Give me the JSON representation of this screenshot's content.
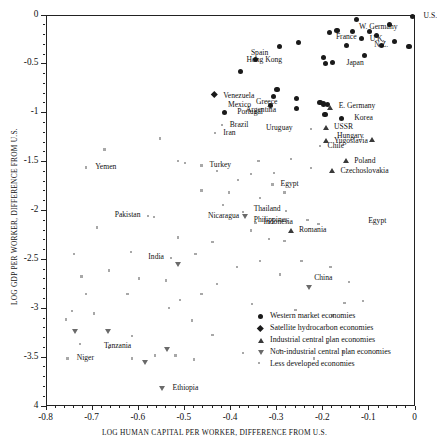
{
  "chart_data": {
    "type": "scatter",
    "title": "",
    "xlabel": "LOG HUMAN CAPITAL PER WORKER, DIFFERENCE FROM U.S.",
    "ylabel": "LOG GDP PER WORKER, DIFFERENCE FROM U.S.",
    "xlim": [
      -0.8,
      0
    ],
    "ylim": [
      -4,
      0
    ],
    "xticks": [
      "-0.8",
      "-0.7",
      "-0.6",
      "-0.5",
      "-0.4",
      "-0.3",
      "-0.2",
      "-0.1",
      "0"
    ],
    "xtick_values": [
      -0.8,
      -0.7,
      -0.6,
      -0.5,
      -0.4,
      -0.3,
      -0.2,
      -0.1,
      0
    ],
    "yticks": [
      "0",
      "-0.5",
      "-1",
      "-1.5",
      "-2",
      "-2.5",
      "-3",
      "-3.5",
      "4"
    ],
    "ytick_values": [
      0,
      -0.5,
      -1,
      -1.5,
      -2,
      -2.5,
      -3,
      -3.5,
      -4
    ],
    "grid": false,
    "legend_position": "inside-lower-right",
    "series": [
      {
        "name": "Western market economies",
        "marker": "circle",
        "points": [
          {
            "label": "U.S.",
            "x": -0.004,
            "y": -0.02,
            "lx": 0.012,
            "ly": -0.02
          },
          {
            "label": "",
            "x": -0.125,
            "y": -0.055
          },
          {
            "label": "",
            "x": -0.055,
            "y": -0.1
          },
          {
            "label": "W. Germany",
            "x": -0.135,
            "y": -0.175,
            "lx": -0.128,
            "ly": -0.13
          },
          {
            "label": "France",
            "x": -0.185,
            "y": -0.185,
            "lx": -0.178,
            "ly": -0.235
          },
          {
            "label": "",
            "x": -0.168,
            "y": -0.16
          },
          {
            "label": "",
            "x": -0.098,
            "y": -0.175
          },
          {
            "label": "",
            "x": -0.082,
            "y": -0.215
          },
          {
            "label": "",
            "x": -0.115,
            "y": -0.245
          },
          {
            "label": "U.K.",
            "x": -0.043,
            "y": -0.275,
            "lx": -0.063,
            "ly": -0.255
          },
          {
            "label": "N.Z.",
            "x": -0.012,
            "y": -0.325,
            "lx": -0.055,
            "ly": -0.315
          },
          {
            "label": "",
            "x": -0.072,
            "y": -0.315
          },
          {
            "label": "",
            "x": -0.252,
            "y": -0.285
          },
          {
            "label": "Spain",
            "x": -0.292,
            "y": -0.33,
            "lx": -0.315,
            "ly": -0.4
          },
          {
            "label": "",
            "x": -0.148,
            "y": -0.315
          },
          {
            "label": "Hong Kong",
            "x": -0.198,
            "y": -0.44,
            "lx": -0.285,
            "ly": -0.47
          },
          {
            "label": "Japan",
            "x": -0.178,
            "y": -0.49,
            "lx": -0.155,
            "ly": -0.5
          },
          {
            "label": "",
            "x": -0.193,
            "y": -0.5
          },
          {
            "label": "",
            "x": -0.108,
            "y": -0.42
          },
          {
            "label": "",
            "x": -0.345,
            "y": -0.46
          },
          {
            "label": "",
            "x": -0.378,
            "y": -0.585
          },
          {
            "label": "",
            "x": -0.298,
            "y": -0.77
          },
          {
            "label": "Venezuela",
            "x": -0.305,
            "y": -0.835,
            "lx": -0.345,
            "ly": -0.835
          },
          {
            "label": "Greece",
            "x": -0.255,
            "y": -0.86,
            "lx": -0.295,
            "ly": -0.9
          },
          {
            "label": "Mexico",
            "x": -0.312,
            "y": -0.935,
            "lx": -0.352,
            "ly": -0.935
          },
          {
            "label": "Argentina",
            "x": -0.256,
            "y": -0.965,
            "lx": -0.298,
            "ly": -0.985
          },
          {
            "label": "",
            "x": -0.205,
            "y": -0.9
          },
          {
            "label": "",
            "x": -0.198,
            "y": -0.915
          },
          {
            "label": "",
            "x": -0.188,
            "y": -0.92
          },
          {
            "label": "",
            "x": -0.194,
            "y": -1.02
          },
          {
            "label": "Korea",
            "x": -0.158,
            "y": -1.06,
            "lx": -0.138,
            "ly": -1.06
          },
          {
            "label": "Portugal",
            "x": -0.412,
            "y": -1.0,
            "lx": -0.392,
            "ly": -1.0
          }
        ]
      },
      {
        "name": "Satellite hydrocarbon economies",
        "marker": "diamond",
        "points": [
          {
            "label": "",
            "x": -0.435,
            "y": -0.82
          }
        ]
      },
      {
        "name": "Industrial central plan economies",
        "marker": "triangle",
        "points": [
          {
            "label": "E. Germany",
            "x": -0.182,
            "y": -0.955,
            "lx": -0.172,
            "ly": -0.945
          },
          {
            "label": "USSR",
            "x": -0.192,
            "y": -1.155,
            "lx": -0.182,
            "ly": -1.155
          },
          {
            "label": "Yugoslavia",
            "x": -0.192,
            "y": -1.29,
            "lx": -0.182,
            "ly": -1.3
          },
          {
            "label": "Hungary",
            "x": -0.093,
            "y": -1.285,
            "lx": -0.108,
            "ly": -1.245
          },
          {
            "label": "Poland",
            "x": -0.148,
            "y": -1.5,
            "lx": -0.138,
            "ly": -1.5
          },
          {
            "label": "Czechoslovakia",
            "x": -0.178,
            "y": -1.6,
            "lx": -0.168,
            "ly": -1.6
          },
          {
            "label": "Romania",
            "x": -0.268,
            "y": -2.21,
            "lx": -0.258,
            "ly": -2.21
          }
        ]
      },
      {
        "name": "Non-industrial central plan economies",
        "marker": "dtriangle",
        "points": [
          {
            "label": "Nicaragua",
            "x": -0.368,
            "y": -2.07,
            "lx": -0.378,
            "ly": -2.07
          },
          {
            "label": "China",
            "x": -0.228,
            "y": -2.79,
            "lx": -0.225,
            "ly": -2.7
          },
          {
            "label": "",
            "x": -0.513,
            "y": -2.56
          },
          {
            "label": "",
            "x": -0.735,
            "y": -3.25
          },
          {
            "label": "",
            "x": -0.665,
            "y": -3.25
          },
          {
            "label": "",
            "x": -0.536,
            "y": -3.43
          },
          {
            "label": "Tanzania",
            "x": -0.585,
            "y": -3.56,
            "lx": -0.612,
            "ly": -3.4
          },
          {
            "label": "Ethiopia",
            "x": -0.548,
            "y": -3.83,
            "lx": -0.532,
            "ly": -3.83
          }
        ]
      },
      {
        "name": "Less developed economies",
        "marker": "dot",
        "points": [
          {
            "label": "Brazil",
            "x": -0.418,
            "y": -1.13,
            "lx": -0.408,
            "ly": -1.13
          },
          {
            "label": "Iran",
            "x": -0.432,
            "y": -1.21,
            "lx": -0.422,
            "ly": -1.22
          },
          {
            "label": "Uruguay",
            "x": -0.225,
            "y": -1.17,
            "lx": -0.262,
            "ly": -1.17
          },
          {
            "label": "Chile",
            "x": -0.205,
            "y": -1.345,
            "lx": -0.196,
            "ly": -1.35
          },
          {
            "label": "Yemen",
            "x": -0.712,
            "y": -1.565,
            "lx": -0.7,
            "ly": -1.565
          },
          {
            "label": "Turkey",
            "x": -0.462,
            "y": -1.545,
            "lx": -0.452,
            "ly": -1.545
          },
          {
            "label": "Egypt",
            "x": -0.308,
            "y": -1.74,
            "lx": -0.298,
            "ly": -1.74
          },
          {
            "label": "Egypt",
            "x": -0.118,
            "y": -2.12,
            "lx": -0.108,
            "ly": -2.12,
            "noMarker": true
          },
          {
            "label": "Pakistan",
            "x": -0.578,
            "y": -2.06,
            "lx": -0.592,
            "ly": -2.06
          },
          {
            "label": "Thailand",
            "x": -0.278,
            "y": -2.01,
            "lx": -0.288,
            "ly": -1.99
          },
          {
            "label": "Philippines",
            "x": -0.232,
            "y": -2.1,
            "lx": -0.272,
            "ly": -2.11
          },
          {
            "label": "Indonesia",
            "x": -0.345,
            "y": -2.13,
            "lx": -0.335,
            "ly": -2.13
          },
          {
            "label": "India",
            "x": -0.528,
            "y": -2.49,
            "lx": -0.541,
            "ly": -2.49
          },
          {
            "label": "Niger",
            "x": -0.752,
            "y": -3.52,
            "lx": -0.74,
            "ly": -3.52
          },
          {
            "label": "",
            "x": -0.672,
            "y": -1.38
          },
          {
            "label": "",
            "x": -0.552,
            "y": -1.27
          },
          {
            "label": "",
            "x": -0.512,
            "y": -1.5
          },
          {
            "label": "",
            "x": -0.497,
            "y": -1.52
          },
          {
            "label": "",
            "x": -0.428,
            "y": -1.6
          },
          {
            "label": "",
            "x": -0.462,
            "y": -1.8
          },
          {
            "label": "",
            "x": -0.402,
            "y": -1.82
          },
          {
            "label": "",
            "x": -0.382,
            "y": -1.69
          },
          {
            "label": "",
            "x": -0.355,
            "y": -1.63
          },
          {
            "label": "",
            "x": -0.338,
            "y": -1.5
          },
          {
            "label": "",
            "x": -0.268,
            "y": -1.48
          },
          {
            "label": "",
            "x": -0.225,
            "y": -1.57
          },
          {
            "label": "",
            "x": -0.305,
            "y": -1.62
          },
          {
            "label": "",
            "x": -0.282,
            "y": -1.82
          },
          {
            "label": "",
            "x": -0.335,
            "y": -1.88
          },
          {
            "label": "",
            "x": -0.415,
            "y": -1.95
          },
          {
            "label": "",
            "x": -0.372,
            "y": -2.02
          },
          {
            "label": "",
            "x": -0.565,
            "y": -2.07
          },
          {
            "label": "",
            "x": -0.355,
            "y": -2.21
          },
          {
            "label": "",
            "x": -0.208,
            "y": -2.14
          },
          {
            "label": "",
            "x": -0.315,
            "y": -2.3
          },
          {
            "label": "",
            "x": -0.282,
            "y": -2.32
          },
          {
            "label": "",
            "x": -0.438,
            "y": -2.33
          },
          {
            "label": "",
            "x": -0.512,
            "y": -2.28
          },
          {
            "label": "",
            "x": -0.475,
            "y": -2.45
          },
          {
            "label": "",
            "x": -0.335,
            "y": -2.52
          },
          {
            "label": "",
            "x": -0.385,
            "y": -2.58
          },
          {
            "label": "",
            "x": -0.615,
            "y": -2.43
          },
          {
            "label": "",
            "x": -0.662,
            "y": -2.62
          },
          {
            "label": "",
            "x": -0.722,
            "y": -2.68
          },
          {
            "label": "",
            "x": -0.598,
            "y": -2.7
          },
          {
            "label": "",
            "x": -0.538,
            "y": -2.72
          },
          {
            "label": "",
            "x": -0.245,
            "y": -2.52
          },
          {
            "label": "",
            "x": -0.182,
            "y": -2.58
          },
          {
            "label": "",
            "x": -0.292,
            "y": -2.66
          },
          {
            "label": "",
            "x": -0.142,
            "y": -2.74
          },
          {
            "label": "",
            "x": -0.428,
            "y": -2.76
          },
          {
            "label": "",
            "x": -0.462,
            "y": -2.86
          },
          {
            "label": "",
            "x": -0.622,
            "y": -2.86
          },
          {
            "label": "",
            "x": -0.712,
            "y": -2.86
          },
          {
            "label": "",
            "x": -0.508,
            "y": -2.92
          },
          {
            "label": "",
            "x": -0.152,
            "y": -2.95
          },
          {
            "label": "",
            "x": -0.352,
            "y": -2.96
          },
          {
            "label": "",
            "x": -0.258,
            "y": -3.02
          },
          {
            "label": "",
            "x": -0.532,
            "y": -3.0
          },
          {
            "label": "",
            "x": -0.695,
            "y": -3.06
          },
          {
            "label": "",
            "x": -0.742,
            "y": -3.03
          },
          {
            "label": "",
            "x": -0.178,
            "y": -3.08
          },
          {
            "label": "",
            "x": -0.112,
            "y": -2.93
          },
          {
            "label": "",
            "x": -0.482,
            "y": -3.13
          },
          {
            "label": "",
            "x": -0.725,
            "y": -3.37
          },
          {
            "label": "",
            "x": -0.662,
            "y": -3.41
          },
          {
            "label": "",
            "x": -0.612,
            "y": -3.29
          },
          {
            "label": "",
            "x": -0.438,
            "y": -3.28
          },
          {
            "label": "",
            "x": -0.188,
            "y": -3.36
          },
          {
            "label": "",
            "x": -0.292,
            "y": -3.43
          },
          {
            "label": "",
            "x": -0.372,
            "y": -3.46
          },
          {
            "label": "",
            "x": -0.612,
            "y": -3.52
          },
          {
            "label": "",
            "x": -0.518,
            "y": -3.49
          },
          {
            "label": "",
            "x": -0.478,
            "y": -3.53
          },
          {
            "label": "",
            "x": -0.562,
            "y": -3.49
          },
          {
            "label": "",
            "x": -0.155,
            "y": -3.45
          },
          {
            "label": "",
            "x": -0.218,
            "y": -3.52
          },
          {
            "label": "",
            "x": -0.738,
            "y": -2.45
          },
          {
            "label": "",
            "x": -0.688,
            "y": -2.18
          },
          {
            "label": "",
            "x": -0.755,
            "y": -3.12
          }
        ]
      }
    ]
  },
  "legend": {
    "items": [
      {
        "marker": "circle",
        "label": "Western market economies"
      },
      {
        "marker": "diamond",
        "label": "Satellite hydrocarbon economies"
      },
      {
        "marker": "triangle",
        "label": "Industrial central plan economies"
      },
      {
        "marker": "dtriangle",
        "label": "Non-industrial central plan economies"
      },
      {
        "marker": "dot",
        "label": "Less developed economies"
      }
    ]
  }
}
